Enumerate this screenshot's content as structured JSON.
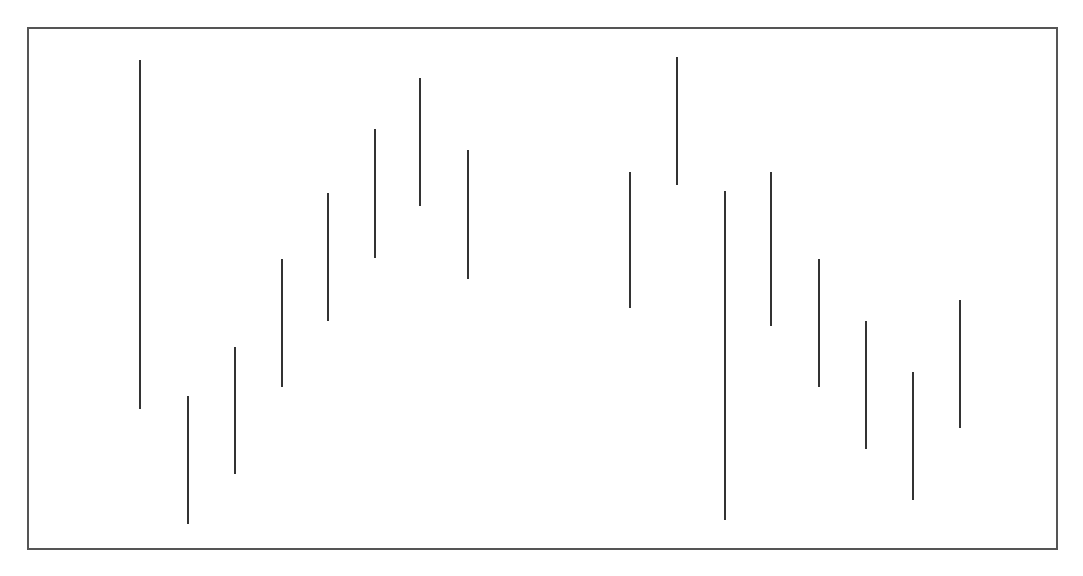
{
  "chart_data": {
    "type": "bar",
    "subtype": "floating-range (high-low) vertical segments",
    "title": "",
    "xlabel": "",
    "ylabel": "",
    "grid": false,
    "legend": null,
    "frame": {
      "left": 27,
      "top": 27,
      "right": 1058,
      "bottom": 550
    },
    "units": "pixels above frame bottom (no axis ticks shown)",
    "ylim": [
      0,
      523
    ],
    "categories": [
      "1",
      "2",
      "3",
      "4",
      "5",
      "6",
      "7",
      "8",
      "9",
      "10",
      "11",
      "12",
      "13",
      "14",
      "15",
      "16"
    ],
    "series": [
      {
        "name": "range",
        "color": "#333333",
        "x_px": [
          140,
          188,
          235,
          282,
          328,
          375,
          420,
          468,
          630,
          677,
          725,
          771,
          819,
          866,
          913,
          960
        ],
        "top_px": [
          60,
          396,
          347,
          259,
          193,
          129,
          78,
          150,
          172,
          57,
          191,
          172,
          259,
          321,
          372,
          300
        ],
        "bottom_px": [
          409,
          524,
          474,
          387,
          321,
          258,
          206,
          279,
          308,
          185,
          520,
          326,
          387,
          449,
          500,
          428
        ],
        "high": [
          490,
          154,
          203,
          291,
          357,
          421,
          472,
          400,
          378,
          493,
          359,
          378,
          291,
          229,
          178,
          250
        ],
        "low": [
          141,
          26,
          76,
          163,
          229,
          292,
          344,
          271,
          242,
          365,
          30,
          224,
          163,
          101,
          50,
          122
        ]
      }
    ]
  }
}
